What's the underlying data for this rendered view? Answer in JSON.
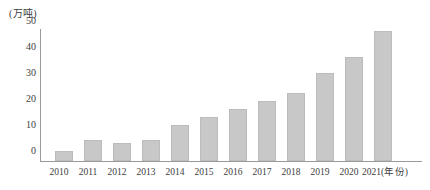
{
  "chart_data": {
    "type": "bar",
    "title": "",
    "subtitle": "",
    "xlabel": "(年份)",
    "ylabel": "(万吨)",
    "categories": [
      "2010",
      "2011",
      "2012",
      "2013",
      "2014",
      "2015",
      "2016",
      "2017",
      "2018",
      "2019",
      "2020",
      "2021"
    ],
    "values": [
      4,
      8,
      7,
      8,
      14,
      17,
      20,
      23,
      26,
      34,
      40,
      50
    ],
    "ylim": [
      0,
      50
    ],
    "ytick_labels": [
      "0",
      "10",
      "20",
      "30",
      "40",
      "50"
    ],
    "ytick_values": [
      0,
      10,
      20,
      30,
      40,
      50
    ],
    "grid": false,
    "legend": false,
    "legend_position": "none",
    "series": [
      {
        "name": "",
        "values": [
          4,
          8,
          7,
          8,
          14,
          17,
          20,
          23,
          26,
          34,
          40,
          50
        ]
      }
    ],
    "bar_color": "#c8c8c8",
    "bar_border_color": "#bcbcbc",
    "axis_color": "#9a9a9a",
    "text_color": "#3d3d3d",
    "last_category_suffix": "(年份)"
  }
}
